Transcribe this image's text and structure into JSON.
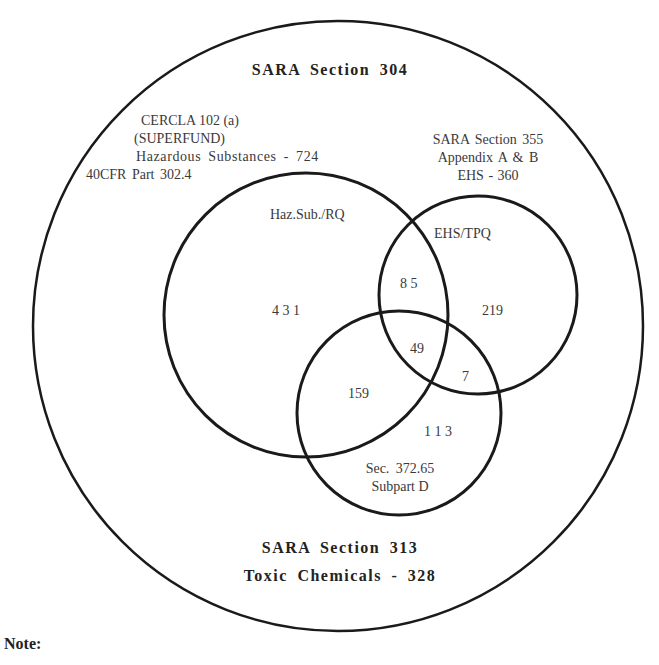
{
  "diagram": {
    "type": "venn",
    "outer_set": {
      "title": "SARA  Section  304"
    },
    "sets": {
      "haz": {
        "source_lines": [
          "CERCLA 102 (a)",
          "(SUPERFUND)",
          "Hazardous  Substances  -  724",
          "40CFR  Part  302.4"
        ],
        "circle_label": "Haz.Sub./RQ"
      },
      "ehs": {
        "source_lines": [
          "SARA  Section  355",
          "Appendix  A  &  B",
          "EHS  -  360"
        ],
        "circle_label": "EHS/TPQ"
      },
      "sec": {
        "circle_label_lines": [
          "Sec.  372.65",
          "Subpart  D"
        ]
      }
    },
    "regions": {
      "haz_only": "4 3 1",
      "ehs_only": "219",
      "haz_ehs": "8 5",
      "haz_ehs_sec": "49",
      "ehs_sec": "7",
      "haz_sec": "159",
      "sec_only": "1 1 3"
    },
    "bottom_titles": [
      "SARA  Section  313",
      "Toxic  Chemicals  -  328"
    ],
    "colors": {
      "stroke": "#1a1a1a",
      "background": "#ffffff"
    }
  },
  "note": {
    "label": "Note:"
  }
}
